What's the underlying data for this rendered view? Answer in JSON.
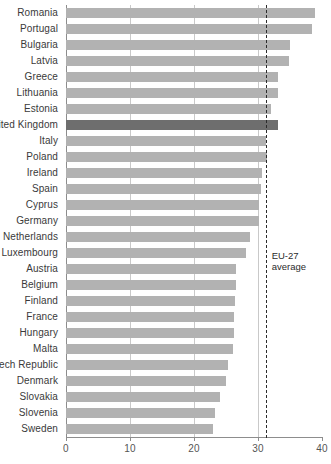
{
  "chart_data": {
    "type": "bar",
    "orientation": "horizontal",
    "title": "",
    "subtitle": "",
    "xlabel": "",
    "ylabel": "",
    "xlim": [
      0,
      40
    ],
    "ylim": null,
    "grid": true,
    "gridlines_x": [
      10,
      20,
      30
    ],
    "legend": null,
    "xticks": [
      "0",
      "10",
      "20",
      "30",
      "40"
    ],
    "xtick_values": [
      0,
      10,
      20,
      30,
      40
    ],
    "categories": [
      "Romania",
      "Portugal",
      "Bulgaria",
      "Latvia",
      "Greece",
      "Lithuania",
      "Estonia",
      "United Kingdom",
      "Italy",
      "Poland",
      "Ireland",
      "Spain",
      "Cyprus",
      "Germany",
      "Netherlands",
      "Luxembourg",
      "Austria",
      "Belgium",
      "Finland",
      "France",
      "Hungary",
      "Malta",
      "Czech Republic",
      "Denmark",
      "Slovakia",
      "Slovenia",
      "Sweden"
    ],
    "values": [
      38.9,
      38.5,
      35.0,
      34.8,
      33.1,
      33.2,
      32.0,
      33.1,
      31.3,
      31.4,
      30.6,
      30.5,
      30.2,
      30.2,
      28.8,
      28.1,
      26.6,
      26.5,
      26.4,
      26.2,
      26.2,
      26.1,
      25.3,
      25.0,
      24.0,
      23.3,
      23.0
    ],
    "highlight_category": "United Kingdom",
    "annotations": [
      {
        "name": "eu27-average",
        "value": 31.2,
        "label_line1": "EU-27",
        "label_line2": "average",
        "style": "dashed-vertical-line"
      }
    ],
    "colors": {
      "bar": "#b2b2b2",
      "bar_highlight": "#6e6e6e",
      "grid": "#c9c9c9",
      "axis": "#8d8d8d",
      "text": "#3a3a3a",
      "annotation": "#2b2b2b",
      "background": "#ffffff"
    }
  }
}
